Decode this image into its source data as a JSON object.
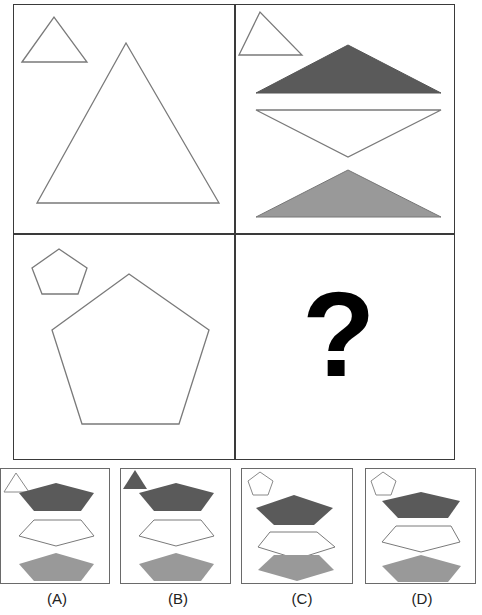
{
  "puzzle": {
    "type": "visual-analogy-matrix",
    "colors": {
      "outline": "#7a7a7a",
      "dark_fill": "#5a5a5a",
      "light_fill": "#999999",
      "white_fill": "#ffffff",
      "border": "#3a3a3a"
    },
    "cells": [
      {
        "position": "top-left",
        "small_shape": "triangle-outline",
        "large_shape": "triangle-outline"
      },
      {
        "position": "top-right",
        "small_shape": "triangle-outline",
        "stack": [
          "dark-flat-triangle",
          "white-inverted-flat-triangle",
          "gray-flat-triangle"
        ]
      },
      {
        "position": "bottom-left",
        "small_shape": "pentagon-outline",
        "large_shape": "pentagon-outline"
      },
      {
        "position": "bottom-right",
        "content": "?"
      }
    ],
    "question_mark": "?"
  },
  "options": [
    {
      "label": "(A)",
      "small_shape": "triangle-outline"
    },
    {
      "label": "(B)",
      "small_shape": "triangle-dark-filled"
    },
    {
      "label": "(C)",
      "small_shape": "pentagon-outline"
    },
    {
      "label": "(D)",
      "small_shape": "pentagon-outline"
    }
  ]
}
